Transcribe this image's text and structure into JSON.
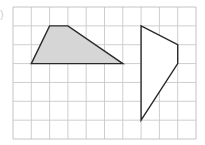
{
  "figure": {
    "label_mark": ")",
    "grid": {
      "origin_x": 13,
      "origin_y": 7,
      "cols": 10,
      "rows": 7,
      "cell_w": 18.3,
      "cell_h": 18.86,
      "line_color": "#c8c8c8",
      "border_color": "#bdbdbd"
    },
    "shapes": [
      {
        "name": "shaded-quadrilateral",
        "fill": "#d6d6d6",
        "stroke": "#2a2a2a",
        "vertices": [
          [
            1,
            3
          ],
          [
            2,
            1
          ],
          [
            3,
            1
          ],
          [
            6,
            3
          ]
        ]
      },
      {
        "name": "unshaded-quadrilateral",
        "fill": "#ffffff",
        "stroke": "#2a2a2a",
        "vertices": [
          [
            7,
            1
          ],
          [
            9,
            2
          ],
          [
            9,
            3
          ],
          [
            7,
            6
          ]
        ]
      }
    ]
  }
}
